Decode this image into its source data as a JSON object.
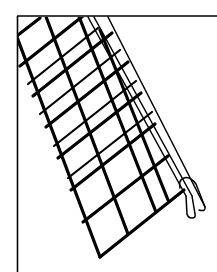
{
  "figure": {
    "style": "black line drawing on white",
    "colors": {
      "background": "#ffffff",
      "ink": "#000000"
    }
  }
}
